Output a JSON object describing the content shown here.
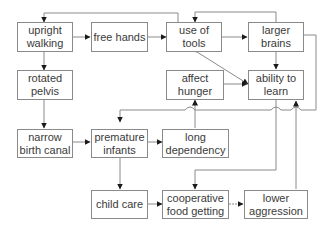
{
  "diagram": {
    "colors": {
      "line": "#8a8a8a",
      "arrow": "#1a1a1a",
      "text": "#3a3a3a"
    },
    "nodes": {
      "upright_walking": "upright\nwalking",
      "free_hands": "free hands",
      "use_of_tools": "use of\ntools",
      "larger_brains": "larger\nbrains",
      "rotated_pelvis": "rotated\npelvis",
      "affect_hunger": "affect\nhunger",
      "ability_to_learn": "ability to\nlearn",
      "narrow_birth_canal": "narrow\nbirth canal",
      "premature_infants": "premature\ninfants",
      "long_dependency": "long\ndependency",
      "child_care": "child care",
      "cooperative_food_getting": "cooperative\nfood getting",
      "lower_aggression": "lower\naggression"
    },
    "edges": [
      [
        "upright_walking",
        "free_hands"
      ],
      [
        "free_hands",
        "use_of_tools"
      ],
      [
        "use_of_tools",
        "larger_brains"
      ],
      [
        "larger_brains",
        "use_of_tools"
      ],
      [
        "use_of_tools",
        "upright_walking"
      ],
      [
        "upright_walking",
        "rotated_pelvis"
      ],
      [
        "rotated_pelvis",
        "narrow_birth_canal"
      ],
      [
        "larger_brains",
        "ability_to_learn"
      ],
      [
        "ability_to_learn",
        "use_of_tools"
      ],
      [
        "use_of_tools",
        "ability_to_learn"
      ],
      [
        "affect_hunger",
        "ability_to_learn"
      ],
      [
        "larger_brains",
        "premature_infants"
      ],
      [
        "narrow_birth_canal",
        "premature_infants"
      ],
      [
        "premature_infants",
        "long_dependency"
      ],
      [
        "long_dependency",
        "affect_hunger"
      ],
      [
        "premature_infants",
        "child_care"
      ],
      [
        "child_care",
        "cooperative_food_getting"
      ],
      [
        "ability_to_learn",
        "cooperative_food_getting"
      ],
      [
        "cooperative_food_getting",
        "lower_aggression"
      ],
      [
        "lower_aggression",
        "ability_to_learn"
      ]
    ]
  }
}
